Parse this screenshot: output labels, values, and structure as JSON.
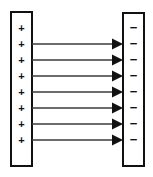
{
  "figure": {
    "background_color": "#ffffff",
    "width": 153,
    "height": 177
  },
  "chart_data": {
    "type": "diagram",
    "xlabel": "",
    "ylabel": "",
    "legend": [],
    "annotations": [],
    "elements": {
      "left_plate": {
        "label": "positive-plate",
        "charge_sign": "+",
        "charge_count": 8,
        "x": 11,
        "y": 12,
        "width": 21,
        "height": 154,
        "fill": "#ffffff",
        "stroke": "#111111",
        "stroke_width": 2,
        "charge_y_positions": [
          29,
          45,
          61,
          77,
          93,
          109,
          125,
          141
        ]
      },
      "right_plate": {
        "label": "negative-plate",
        "charge_sign": "−",
        "charge_count": 8,
        "x": 123,
        "y": 13,
        "width": 21,
        "height": 153,
        "fill": "#ffffff",
        "stroke": "#111111",
        "stroke_width": 2,
        "charge_y_positions": [
          29,
          45,
          61,
          77,
          93,
          109,
          125,
          141
        ]
      },
      "field_lines": {
        "label": "electric-field-lines",
        "count": 7,
        "direction": "left-to-right",
        "x_start": 32,
        "x_end": 123,
        "shaft_color": "#3a3a3a",
        "shaft_width": 1.6,
        "head_color": "#111111",
        "head_length": 11,
        "head_half_height": 5.5,
        "y_positions": [
          44,
          60,
          76,
          92,
          108,
          124,
          140
        ]
      }
    }
  }
}
